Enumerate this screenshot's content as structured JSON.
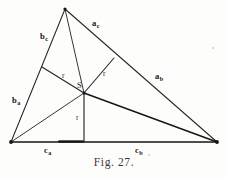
{
  "figure": {
    "caption": "Fig. 27.",
    "background_color": "#fdfdfb",
    "ink_color": "#1a1a1a"
  },
  "labels": {
    "side_a_c": {
      "base": "a",
      "sub": "c",
      "x": 92,
      "y": 19
    },
    "side_a_b": {
      "base": "a",
      "sub": "b",
      "x": 155,
      "y": 72
    },
    "side_b_c": {
      "base": "b",
      "sub": "c",
      "x": 40,
      "y": 32
    },
    "side_b_a": {
      "base": "b",
      "sub": "a",
      "x": 12,
      "y": 96
    },
    "side_c_a": {
      "base": "c",
      "sub": "a",
      "x": 44,
      "y": 146
    },
    "side_c_b": {
      "base": "c",
      "sub": "b",
      "x": 135,
      "y": 146
    },
    "radius_left": {
      "text": "r",
      "x": 62,
      "y": 72
    },
    "radius_right": {
      "text": "r",
      "x": 103,
      "y": 70
    },
    "radius_bottom": {
      "text": "r",
      "x": 76,
      "y": 114
    },
    "incenter": {
      "text": "S",
      "x": 77,
      "y": 81
    }
  },
  "geometry": {
    "vertex_apex": {
      "x": 65,
      "y": 9
    },
    "vertex_left": {
      "x": 11,
      "y": 142
    },
    "vertex_right": {
      "x": 217,
      "y": 142
    },
    "incenter_point": {
      "x": 84,
      "y": 93
    },
    "touch_point_left_side": {
      "x": 42,
      "y": 67
    },
    "touch_point_right_side": {
      "x": 114,
      "y": 58
    },
    "touch_point_base": {
      "x": 84,
      "y": 142
    }
  }
}
